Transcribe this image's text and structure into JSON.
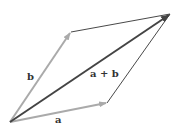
{
  "diagram": {
    "type": "vector-addition-parallelogram",
    "colors": {
      "vector_a": "#aaaaaa",
      "vector_b": "#aaaaaa",
      "resultant": "#444444",
      "parallel_edges": "#333333",
      "labels": "#333333"
    },
    "points": {
      "origin": [
        10,
        122
      ],
      "a_tip": [
        107,
        103
      ],
      "b_tip": [
        71,
        32
      ],
      "sum_tip": [
        170,
        14
      ]
    },
    "labels": {
      "a": "a",
      "b": "b",
      "sum": "a + b"
    }
  }
}
